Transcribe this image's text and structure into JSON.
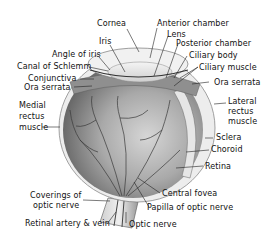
{
  "diagram": {
    "labels": {
      "cornea": "Cornea",
      "anterior_chamber": "Anterior chamber",
      "iris": "Iris",
      "lens": "Lens",
      "posterior_chamber": "Posterior chamber",
      "angle_of_iris": "Angle of iris",
      "ciliary_body": "Ciliary body",
      "canal_of_schlemm": "Canal of Schlemm",
      "ciliary_muscle": "Ciliary muscle",
      "conjunctiva": "Conjunctiva",
      "ora_serrata_left": "Ora serrata",
      "ora_serrata_right": "Ora serrata",
      "medial_rectus_1": "Medial",
      "medial_rectus_2": "rectus",
      "medial_rectus_3": "muscle",
      "lateral_rectus_1": "Lateral",
      "lateral_rectus_2": "rectus",
      "lateral_rectus_3": "muscle",
      "sclera": "Sclera",
      "choroid": "Choroid",
      "retina": "Retina",
      "central_fovea": "Central fovea",
      "coverings_1": "Coverings of",
      "coverings_2": "optic nerve",
      "papilla": "Papilla of optic nerve",
      "retinal_artery_vein": "Retinal artery & vein",
      "optic_nerve": "Optic nerve"
    },
    "colors": {
      "background": "#ffffff",
      "eyeball_dark": "#6f6f6f",
      "eyeball_mid": "#a4a4a4",
      "eyeball_light": "#d9d9d9",
      "vessel": "#3a3a3a",
      "label_text": "#111111",
      "leader_line": "#222222"
    }
  }
}
